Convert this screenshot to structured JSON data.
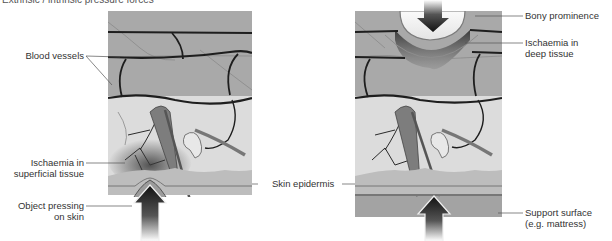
{
  "figure": {
    "title": "Extrinsic / intrinsic pressure forces",
    "panels": [
      {
        "id": "left",
        "description": "Object pressing on skin from below causing superficial ischaemia",
        "labels": {
          "blood_vessels": "Blood vessels",
          "ischaemia_superficial_1": "Ischaemia in",
          "ischaemia_superficial_2": "superficial tissue",
          "object_pressing_1": "Object pressing",
          "object_pressing_2": "on skin"
        }
      },
      {
        "id": "right",
        "description": "Bony prominence pressing from above against support surface causing deep tissue ischaemia",
        "labels": {
          "bony_prominence": "Bony prominence",
          "ischaemia_deep_1": "Ischaemia in",
          "ischaemia_deep_2": "deep tissue",
          "support_surface_1": "Support surface",
          "support_surface_2": "(e.g. mattress)"
        }
      }
    ],
    "shared_labels": {
      "skin_epidermis": "Skin epidermis"
    },
    "colors": {
      "deep_tissue": "#a9a9a9",
      "dermis": "#d9d9d9",
      "epidermis": "#bdbdbd",
      "vessel": "#1e1e1e",
      "arrow": "#111111",
      "support_surface": "#a3a3a3"
    }
  }
}
